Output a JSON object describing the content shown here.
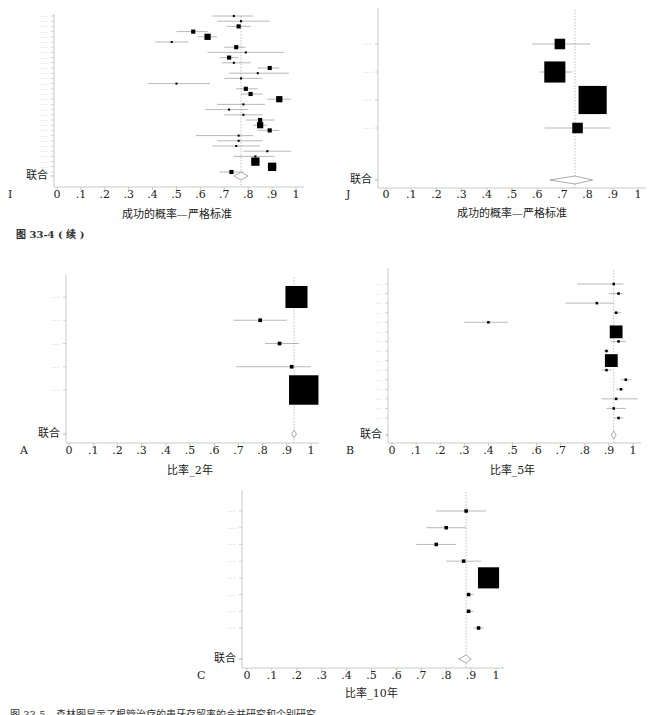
{
  "captions": {
    "fig_33_4_cont": "图 33-4 ( 续 )",
    "fig_33_5": "图 33-5　森林图显示了根管治疗的患牙存留率的合并研究和个别研究"
  },
  "common": {
    "pooled_label": "联合",
    "ticks": [
      "0",
      ".1",
      ".2",
      ".3",
      ".4",
      ".5",
      ".6",
      ".7",
      ".8",
      ".9",
      "1"
    ]
  },
  "chart_data": [
    {
      "panel": "I",
      "type": "forest",
      "xlabel": "成功的概率—严格标准",
      "xlim": [
        0,
        1
      ],
      "note": "Study labels illegible at this resolution; values are estimated from the plot markers.",
      "pooled": {
        "est": 0.77,
        "lo": 0.74,
        "hi": 0.8
      },
      "studies": [
        {
          "label": "",
          "est": 0.74,
          "lo": 0.65,
          "hi": 0.82,
          "w": 1
        },
        {
          "label": "",
          "est": 0.77,
          "lo": 0.67,
          "hi": 0.89,
          "w": 1
        },
        {
          "label": "",
          "est": 0.76,
          "lo": 0.71,
          "hi": 0.81,
          "w": 2
        },
        {
          "label": "",
          "est": 0.57,
          "lo": 0.5,
          "hi": 0.63,
          "w": 2
        },
        {
          "label": "",
          "est": 0.63,
          "lo": 0.59,
          "hi": 0.67,
          "w": 3
        },
        {
          "label": "",
          "est": 0.48,
          "lo": 0.41,
          "hi": 0.55,
          "w": 1
        },
        {
          "label": "",
          "est": 0.75,
          "lo": 0.7,
          "hi": 0.79,
          "w": 2
        },
        {
          "label": "",
          "est": 0.79,
          "lo": 0.63,
          "hi": 0.95,
          "w": 1
        },
        {
          "label": "",
          "est": 0.72,
          "lo": 0.68,
          "hi": 0.76,
          "w": 2
        },
        {
          "label": "",
          "est": 0.74,
          "lo": 0.69,
          "hi": 0.81,
          "w": 1
        },
        {
          "label": "",
          "est": 0.89,
          "lo": 0.84,
          "hi": 0.93,
          "w": 2
        },
        {
          "label": "",
          "est": 0.84,
          "lo": 0.72,
          "hi": 0.97,
          "w": 1
        },
        {
          "label": "",
          "est": 0.77,
          "lo": 0.7,
          "hi": 0.86,
          "w": 1
        },
        {
          "label": "",
          "est": 0.5,
          "lo": 0.38,
          "hi": 0.64,
          "w": 1
        },
        {
          "label": "",
          "est": 0.79,
          "lo": 0.75,
          "hi": 0.84,
          "w": 2
        },
        {
          "label": "",
          "est": 0.81,
          "lo": 0.77,
          "hi": 0.86,
          "w": 2
        },
        {
          "label": "",
          "est": 0.93,
          "lo": 0.88,
          "hi": 0.98,
          "w": 3
        },
        {
          "label": "",
          "est": 0.78,
          "lo": 0.67,
          "hi": 0.87,
          "w": 1
        },
        {
          "label": "",
          "est": 0.72,
          "lo": 0.62,
          "hi": 0.8,
          "w": 1
        },
        {
          "label": "",
          "est": 0.78,
          "lo": 0.7,
          "hi": 0.86,
          "w": 1
        },
        {
          "label": "",
          "est": 0.85,
          "lo": 0.79,
          "hi": 0.91,
          "w": 2
        },
        {
          "label": "",
          "est": 0.85,
          "lo": 0.82,
          "hi": 0.88,
          "w": 3
        },
        {
          "label": "",
          "est": 0.89,
          "lo": 0.84,
          "hi": 0.93,
          "w": 2
        },
        {
          "label": "",
          "est": 0.76,
          "lo": 0.58,
          "hi": 0.82,
          "w": 1
        },
        {
          "label": "",
          "est": 0.76,
          "lo": 0.67,
          "hi": 0.86,
          "w": 1
        },
        {
          "label": "",
          "est": 0.75,
          "lo": 0.65,
          "hi": 0.85,
          "w": 1
        },
        {
          "label": "",
          "est": 0.88,
          "lo": 0.78,
          "hi": 0.98,
          "w": 1
        },
        {
          "label": "",
          "est": 0.83,
          "lo": 0.74,
          "hi": 0.91,
          "w": 1
        },
        {
          "label": "",
          "est": 0.83,
          "lo": 0.81,
          "hi": 0.85,
          "w": 4
        },
        {
          "label": "",
          "est": 0.9,
          "lo": 0.88,
          "hi": 0.92,
          "w": 4
        },
        {
          "label": "",
          "est": 0.73,
          "lo": 0.68,
          "hi": 0.78,
          "w": 2
        }
      ]
    },
    {
      "panel": "J",
      "type": "forest",
      "xlabel": "成功的概率—严格标准",
      "xlim": [
        0,
        1
      ],
      "note": "Study labels illegible at this resolution; values are estimated from the plot markers.",
      "pooled": {
        "est": 0.75,
        "lo": 0.65,
        "hi": 0.82
      },
      "studies": [
        {
          "label": "",
          "est": 0.69,
          "lo": 0.58,
          "hi": 0.81,
          "w": 3
        },
        {
          "label": "",
          "est": 0.67,
          "lo": 0.61,
          "hi": 0.74,
          "w": 6
        },
        {
          "label": "",
          "est": 0.82,
          "lo": 0.78,
          "hi": 0.86,
          "w": 8
        },
        {
          "label": "",
          "est": 0.76,
          "lo": 0.63,
          "hi": 0.89,
          "w": 3
        }
      ]
    },
    {
      "panel": "A",
      "type": "forest",
      "xlabel": "比率_2年",
      "xlim": [
        0,
        1
      ],
      "note": "Study labels illegible at this resolution; values are estimated from the plot markers.",
      "pooled": {
        "est": 0.93,
        "lo": 0.92,
        "hi": 0.94
      },
      "studies": [
        {
          "label": "",
          "est": 0.94,
          "lo": 0.92,
          "hi": 0.96,
          "w": 6
        },
        {
          "label": "",
          "est": 0.79,
          "lo": 0.68,
          "hi": 0.9,
          "w": 1
        },
        {
          "label": "",
          "est": 0.87,
          "lo": 0.81,
          "hi": 0.95,
          "w": 1
        },
        {
          "label": "",
          "est": 0.92,
          "lo": 0.69,
          "hi": 1.0,
          "w": 1
        },
        {
          "label": "",
          "est": 0.97,
          "lo": 0.94,
          "hi": 0.99,
          "w": 8
        }
      ]
    },
    {
      "panel": "B",
      "type": "forest",
      "xlabel": "比率_5年",
      "xlim": [
        0,
        1
      ],
      "note": "Study labels illegible at this resolution; values are estimated from the plot markers.",
      "pooled": {
        "est": 0.92,
        "lo": 0.91,
        "hi": 0.93
      },
      "studies": [
        {
          "label": "",
          "est": 0.92,
          "lo": 0.77,
          "hi": 0.96,
          "w": 1
        },
        {
          "label": "",
          "est": 0.94,
          "lo": 0.9,
          "hi": 0.96,
          "w": 1
        },
        {
          "label": "",
          "est": 0.85,
          "lo": 0.72,
          "hi": 0.92,
          "w": 1
        },
        {
          "label": "",
          "est": 0.93,
          "lo": 0.92,
          "hi": 0.95,
          "w": 1
        },
        {
          "label": "",
          "est": 0.4,
          "lo": 0.3,
          "hi": 0.48,
          "w": 1
        },
        {
          "label": "",
          "est": 0.93,
          "lo": 0.92,
          "hi": 0.95,
          "w": 5
        },
        {
          "label": "",
          "est": 0.94,
          "lo": 0.91,
          "hi": 0.97,
          "w": 1
        },
        {
          "label": "",
          "est": 0.89,
          "lo": 0.88,
          "hi": 0.9,
          "w": 1
        },
        {
          "label": "",
          "est": 0.91,
          "lo": 0.9,
          "hi": 0.93,
          "w": 5
        },
        {
          "label": "",
          "est": 0.89,
          "lo": 0.87,
          "hi": 0.91,
          "w": 1
        },
        {
          "label": "",
          "est": 0.97,
          "lo": 0.95,
          "hi": 0.99,
          "w": 1
        },
        {
          "label": "",
          "est": 0.95,
          "lo": 0.93,
          "hi": 0.96,
          "w": 1
        },
        {
          "label": "",
          "est": 0.93,
          "lo": 0.87,
          "hi": 1.02,
          "w": 1
        },
        {
          "label": "",
          "est": 0.92,
          "lo": 0.89,
          "hi": 0.97,
          "w": 1
        },
        {
          "label": "",
          "est": 0.94,
          "lo": 0.92,
          "hi": 0.96,
          "w": 1
        }
      ]
    },
    {
      "panel": "C",
      "type": "forest",
      "xlabel": "比率_10年",
      "xlim": [
        0,
        1
      ],
      "note": "Study labels illegible at this resolution; values are estimated from the plot markers.",
      "pooled": {
        "est": 0.88,
        "lo": 0.85,
        "hi": 0.9
      },
      "studies": [
        {
          "label": "",
          "est": 0.88,
          "lo": 0.76,
          "hi": 0.96,
          "w": 1
        },
        {
          "label": "",
          "est": 0.8,
          "lo": 0.72,
          "hi": 0.88,
          "w": 1
        },
        {
          "label": "",
          "est": 0.76,
          "lo": 0.68,
          "hi": 0.84,
          "w": 1
        },
        {
          "label": "",
          "est": 0.87,
          "lo": 0.8,
          "hi": 0.94,
          "w": 1
        },
        {
          "label": "",
          "est": 0.97,
          "lo": 0.95,
          "hi": 0.99,
          "w": 6
        },
        {
          "label": "",
          "est": 0.89,
          "lo": 0.88,
          "hi": 0.91,
          "w": 1
        },
        {
          "label": "",
          "est": 0.89,
          "lo": 0.88,
          "hi": 0.91,
          "w": 1
        },
        {
          "label": "",
          "est": 0.93,
          "lo": 0.91,
          "hi": 0.95,
          "w": 1
        }
      ]
    }
  ]
}
